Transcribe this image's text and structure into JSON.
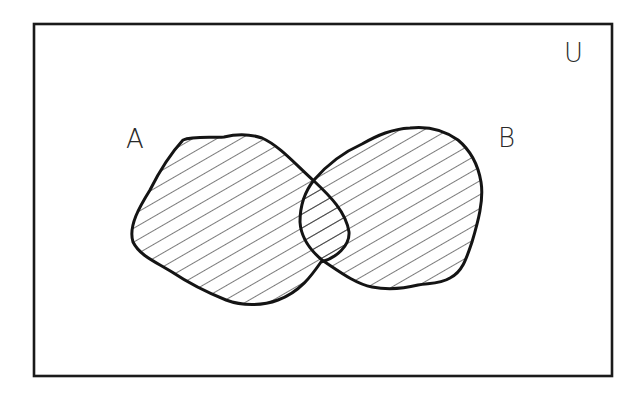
{
  "diagram": {
    "type": "venn",
    "title": "",
    "universe_label": "U",
    "sets": [
      {
        "id": "A",
        "label": "A",
        "shaded": true
      },
      {
        "id": "B",
        "label": "B",
        "shaded": true
      }
    ],
    "shaded_region": "A ∪ B",
    "hatch": {
      "style": "diagonal",
      "angle_deg": 30,
      "color": "#222222"
    },
    "outline_color": "#141414",
    "background_color": "#ffffff"
  }
}
